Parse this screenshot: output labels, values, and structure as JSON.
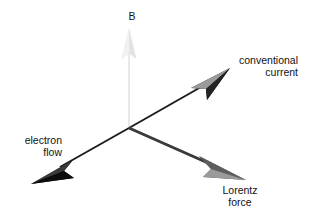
{
  "diagram": {
    "title_visible": false,
    "background_color": "#ffffff",
    "origin": {
      "x": 129,
      "y": 128
    },
    "labels": {
      "magnetic_field": "B",
      "conventional_current_line1": "conventional",
      "conventional_current_line2": "current",
      "electron_flow_line1": "electron",
      "electron_flow_line2": "flow",
      "lorentz_force_line1": "Lorentz",
      "lorentz_force_line2": "force"
    },
    "vectors": [
      {
        "name": "magnetic-field",
        "label": "B",
        "from": {
          "x": 129,
          "y": 128
        },
        "to": {
          "x": 129,
          "y": 30
        },
        "color": "#e6e6e6",
        "shade_color": "#f2f2f2",
        "stroke_width": 2
      },
      {
        "name": "conventional-current",
        "label": "conventional current",
        "from": {
          "x": 129,
          "y": 128
        },
        "to": {
          "x": 228,
          "y": 71
        },
        "color": "#1a1a1a",
        "shade_color": "#8c8c8c",
        "stroke_width": 2
      },
      {
        "name": "electron-flow",
        "label": "electron flow",
        "from": {
          "x": 129,
          "y": 128
        },
        "to": {
          "x": 34,
          "y": 181
        },
        "color": "#1a1a1a",
        "shade_color": "#6e6e6e",
        "stroke_width": 2
      },
      {
        "name": "lorentz-force",
        "label": "Lorentz force",
        "from": {
          "x": 129,
          "y": 128
        },
        "to": {
          "x": 243,
          "y": 180
        },
        "color": "#3d3d3d",
        "shade_color": "#8f8f8f",
        "stroke_width": 3
      }
    ],
    "colors": {
      "dark": "#1a1a1a",
      "mid_gray": "#6e6e6e",
      "light_gray": "#e6e6e6",
      "text": "#111111"
    }
  }
}
